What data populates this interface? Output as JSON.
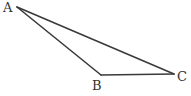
{
  "diagram": {
    "type": "triangle",
    "vertices": [
      {
        "id": "A",
        "label": "A",
        "x": 17,
        "y": 7,
        "label_x": 3,
        "label_y": 12
      },
      {
        "id": "B",
        "label": "B",
        "x": 101,
        "y": 75,
        "label_x": 92,
        "label_y": 90
      },
      {
        "id": "C",
        "label": "C",
        "x": 174,
        "y": 74,
        "label_x": 177,
        "label_y": 81
      }
    ],
    "edges": [
      {
        "from": "A",
        "to": "B"
      },
      {
        "from": "B",
        "to": "C"
      },
      {
        "from": "A",
        "to": "C"
      }
    ],
    "colors": {
      "stroke": "#3a3a3a",
      "text": "#333333",
      "background": "#ffffff"
    }
  }
}
